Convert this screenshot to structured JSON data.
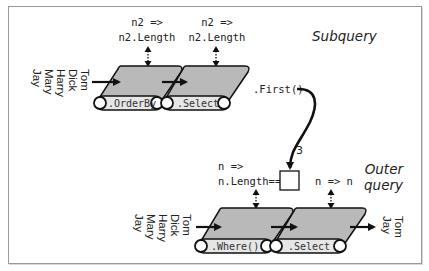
{
  "subquery": {
    "title": "Subquery",
    "input_names": [
      "Tom",
      "Dick",
      "Harry",
      "Mary",
      "Jay"
    ],
    "operators": [
      {
        "label": ".OrderBy",
        "lambda_line1": "n2 =>",
        "lambda_line2": "n2.Length"
      },
      {
        "label": ".Select",
        "lambda_line1": "n2 =>",
        "lambda_line2": "n2.Length"
      }
    ],
    "output_op": ".First()",
    "output_value": "3"
  },
  "outer_query": {
    "title_line1": "Outer",
    "title_line2": "query",
    "input_names": [
      "Tom",
      "Dick",
      "Harry",
      "Mary",
      "Jay"
    ],
    "operators": [
      {
        "label": ".Where()",
        "lambda_line1": "n =>",
        "lambda_line2": "n.Length=="
      },
      {
        "label": ".Select",
        "lambda_line1": "n => n",
        "lambda_line2": ""
      }
    ],
    "output_names": [
      "Tom",
      "Jay"
    ]
  },
  "colors": {
    "belt_fill": "#b9b9b9",
    "roller_fill": "#e6e6e6",
    "stroke": "#111111",
    "frame": "#9a9a9a"
  }
}
